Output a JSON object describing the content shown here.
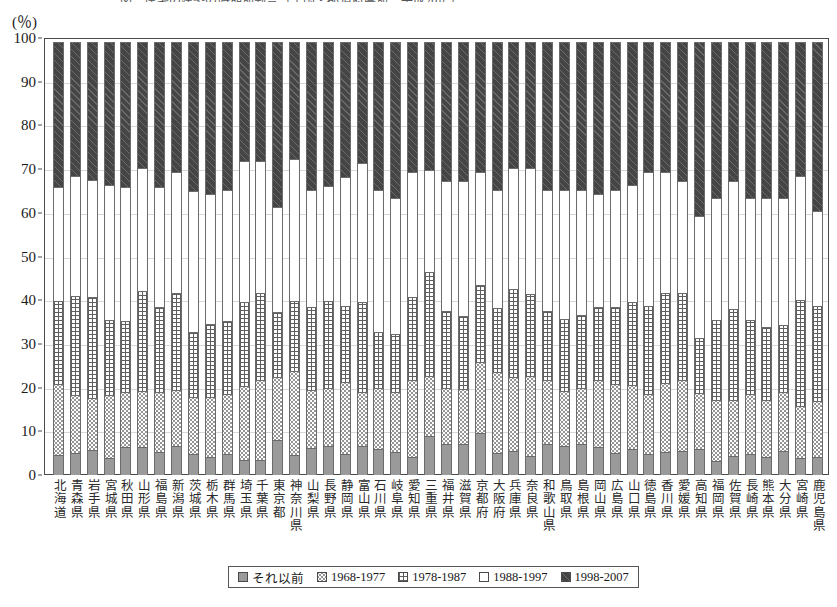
{
  "chart_title": "図　住宅の建築の時期別割合（全国・都道府県別，平成20年）",
  "axis": {
    "unit_label": "(％)",
    "y_ticks": [
      0,
      10,
      20,
      30,
      40,
      50,
      60,
      70,
      80,
      90,
      100
    ],
    "y_min": 0,
    "y_max": 100
  },
  "legend": {
    "items": [
      {
        "label": "それ以前",
        "pattern": "pat-pre",
        "color": "#9a9a9a"
      },
      {
        "label": "1968-1977",
        "pattern": "pat-6877",
        "color": "#fdfdfd"
      },
      {
        "label": "1978-1987",
        "pattern": "pat-7887",
        "color": "#fdfdfd"
      },
      {
        "label": "1988-1997",
        "pattern": "pat-8897",
        "color": "#ffffff"
      },
      {
        "label": "1998-2007",
        "pattern": "pat-9807",
        "color": "#454545"
      }
    ]
  },
  "chart_data": {
    "type": "bar",
    "subtype": "stacked-100-percent",
    "title": "図　住宅の建築の時期別割合（全国・都道府県別，平成20年）",
    "xlabel": "",
    "ylabel": "(％)",
    "ylim": [
      0,
      100
    ],
    "grid": true,
    "legend_position": "bottom",
    "categories": [
      "北海道",
      "青森県",
      "岩手県",
      "宮城県",
      "秋田県",
      "山形県",
      "福島県",
      "新潟県",
      "茨城県",
      "栃木県",
      "群馬県",
      "埼玉県",
      "千葉県",
      "東京都",
      "神奈川県",
      "山梨県",
      "長野県",
      "静岡県",
      "富山県",
      "石川県",
      "岐阜県",
      "愛知県",
      "三重県",
      "福井県",
      "滋賀県",
      "京都府",
      "大阪府",
      "兵庫県",
      "奈良県",
      "和歌山県",
      "鳥取県",
      "島根県",
      "岡山県",
      "広島県",
      "山口県",
      "徳島県",
      "香川県",
      "愛媛県",
      "高知県",
      "福岡県",
      "佐賀県",
      "長崎県",
      "熊本県",
      "大分県",
      "宮崎県",
      "鹿児島県"
    ],
    "series": [
      {
        "name": "それ以前",
        "values": [
          4.6,
          5.0,
          5.8,
          4.0,
          6.3,
          6.5,
          5.2,
          6.7,
          4.7,
          4.2,
          4.8,
          3.5,
          3.5,
          8.0,
          4.5,
          6.2,
          6.6,
          4.8,
          6.7,
          6.0,
          5.2,
          4.2,
          9.0,
          7.2,
          7.0,
          9.5,
          5.0,
          5.6,
          4.4,
          7.0,
          6.7,
          7.2,
          6.4,
          5.0,
          6.0,
          4.8,
          5.2,
          5.4,
          6.0,
          3.2,
          4.4,
          4.8,
          4.2,
          5.4,
          4.0,
          4.2
        ]
      },
      {
        "name": "1968-1977",
        "values": [
          16.4,
          13.5,
          12.0,
          14.5,
          13.0,
          13.0,
          14.0,
          13.0,
          13.3,
          13.8,
          14.0,
          17.0,
          18.5,
          14.6,
          19.5,
          13.6,
          13.6,
          16.8,
          12.5,
          14.2,
          14.0,
          17.8,
          14.0,
          13.0,
          13.0,
          16.7,
          18.7,
          17.0,
          18.6,
          15.0,
          12.8,
          13.0,
          15.5,
          16.0,
          14.8,
          14.0,
          16.2,
          16.6,
          13.0,
          14.3,
          13.0,
          14.0,
          13.2,
          13.8,
          12.0,
          13.0
        ]
      },
      {
        "name": "1978-1987",
        "values": [
          19.2,
          23.0,
          23.4,
          17.5,
          16.4,
          23.1,
          19.8,
          22.5,
          15.2,
          17.0,
          17.0,
          19.5,
          20.0,
          15.2,
          16.3,
          19.2,
          20.0,
          17.6,
          20.8,
          13.0,
          13.6,
          19.3,
          24.0,
          17.8,
          16.8,
          17.8,
          15.0,
          20.4,
          19.0,
          16.0,
          16.7,
          16.8,
          17.0,
          17.8,
          19.2,
          20.3,
          20.8,
          20.0,
          12.8,
          18.5,
          21.0,
          17.2,
          17.0,
          15.6,
          24.6,
          22.0
        ]
      },
      {
        "name": "1988-1997",
        "values": [
          26.4,
          27.5,
          27.0,
          31.0,
          30.8,
          28.4,
          27.5,
          27.8,
          32.5,
          30.0,
          30.0,
          32.5,
          30.5,
          24.2,
          32.7,
          27.0,
          26.6,
          29.8,
          32.0,
          32.8,
          31.2,
          28.7,
          23.5,
          30.0,
          31.2,
          26.0,
          27.3,
          28.0,
          29.0,
          28.0,
          29.8,
          29.0,
          26.1,
          27.2,
          27.0,
          30.9,
          27.8,
          26.0,
          28.2,
          28.0,
          29.6,
          28.0,
          29.6,
          29.2,
          28.4,
          21.8
        ]
      },
      {
        "name": "1998-2007",
        "values": [
          33.4,
          31.0,
          31.8,
          33.0,
          33.5,
          29.0,
          33.5,
          30.0,
          34.3,
          35.0,
          34.2,
          27.5,
          27.5,
          38.0,
          27.0,
          34.0,
          33.2,
          31.0,
          28.0,
          34.0,
          36.0,
          30.0,
          29.5,
          32.0,
          32.0,
          30.0,
          34.0,
          29.0,
          29.0,
          34.0,
          34.0,
          34.0,
          35.0,
          34.0,
          33.0,
          30.0,
          30.0,
          32.0,
          40.0,
          36.0,
          32.0,
          36.0,
          36.0,
          36.0,
          31.0,
          39.0
        ]
      }
    ]
  }
}
